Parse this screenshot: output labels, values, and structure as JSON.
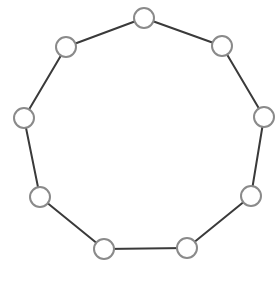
{
  "diagram": {
    "type": "cycle-graph",
    "node_count": 9,
    "colors": {
      "background": "#ffffff",
      "edge": "#3a3a3a",
      "node_fill": "#ffffff",
      "node_stroke": "#8a8a8a"
    },
    "node_radius": 10,
    "edge_width": 2,
    "node_stroke_width": 2,
    "nodes": [
      {
        "id": "n1",
        "x": 144,
        "y": 18
      },
      {
        "id": "n2",
        "x": 222,
        "y": 46
      },
      {
        "id": "n3",
        "x": 264,
        "y": 117
      },
      {
        "id": "n4",
        "x": 251,
        "y": 196
      },
      {
        "id": "n5",
        "x": 187,
        "y": 248
      },
      {
        "id": "n6",
        "x": 104,
        "y": 249
      },
      {
        "id": "n7",
        "x": 40,
        "y": 197
      },
      {
        "id": "n8",
        "x": 24,
        "y": 118
      },
      {
        "id": "n9",
        "x": 66,
        "y": 47
      }
    ],
    "edges": [
      [
        "n1",
        "n2"
      ],
      [
        "n2",
        "n3"
      ],
      [
        "n3",
        "n4"
      ],
      [
        "n4",
        "n5"
      ],
      [
        "n5",
        "n6"
      ],
      [
        "n6",
        "n7"
      ],
      [
        "n7",
        "n8"
      ],
      [
        "n8",
        "n9"
      ],
      [
        "n9",
        "n1"
      ]
    ]
  }
}
